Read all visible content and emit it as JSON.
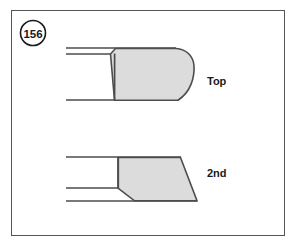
{
  "figure": {
    "number_label": "156",
    "frame": {
      "x": 11,
      "y": 10,
      "width": 274,
      "height": 226
    },
    "background_color": "#ffffff",
    "border_color": "#555555"
  },
  "style": {
    "ring_fill": "#dcdcdc",
    "ring_stroke": "#4d4d4d",
    "groove_line_color": "#4d4d4d",
    "text_color": "#1a1a1a"
  },
  "diagrams": [
    {
      "name": "top-ring",
      "label": "Top",
      "label_position": {
        "x": 207,
        "y": 85
      },
      "description": "Barrel-faced compression ring profile with rounded outer face and chamfered upper inner corner",
      "ring_path": "M 115 49 L 175 49 Q 192 50 194 70 Q 196 90 179 100 L 115 100 Z",
      "ring_chamfer_path": "M 110 54 L 115 49",
      "groove_lines": [
        {
          "x1": 66,
          "y1": 48,
          "x2": 176,
          "y2": 48
        },
        {
          "x1": 66,
          "y1": 54,
          "x2": 110,
          "y2": 54
        },
        {
          "x1": 66,
          "y1": 100,
          "x2": 115,
          "y2": 100
        }
      ],
      "ring_left_edge": {
        "x1": 114,
        "y1": 54,
        "x2": 114,
        "y2": 100
      }
    },
    {
      "name": "second-ring",
      "label": "2nd",
      "label_position": {
        "x": 207,
        "y": 177
      },
      "description": "Tapered (Napier) second compression ring profile with undercut lower inner corner",
      "ring_path": "M 118 157 L 180 157 L 197 201 L 134 201 L 118 188 Z",
      "groove_lines": [
        {
          "x1": 66,
          "y1": 157,
          "x2": 180,
          "y2": 157
        },
        {
          "x1": 66,
          "y1": 188,
          "x2": 118,
          "y2": 188
        },
        {
          "x1": 66,
          "y1": 201,
          "x2": 197,
          "y2": 201
        }
      ],
      "ring_left_edge": {
        "x1": 118,
        "y1": 157,
        "x2": 118,
        "y2": 188
      }
    }
  ]
}
